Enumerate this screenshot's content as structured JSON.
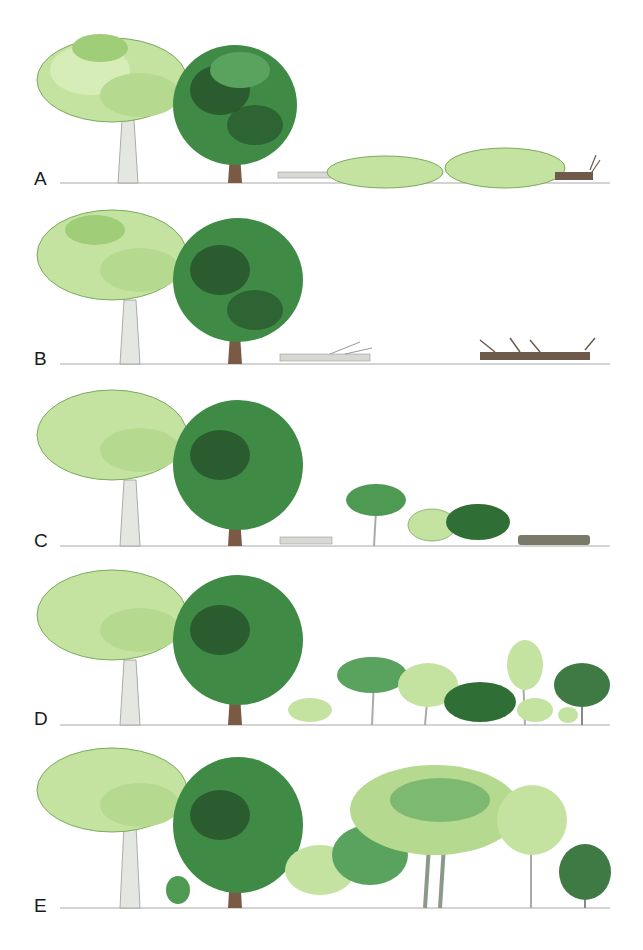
{
  "figure": {
    "colors": {
      "light_crown": "#c4e3a0",
      "light_crown_shade": "#8fc46a",
      "dark_crown": "#3f8a45",
      "dark_crown_shade": "#1d3d22",
      "birch_trunk": "#e4e6e2",
      "dark_trunk": "#7a5a44",
      "fallen_log_light": "#d8d8d2",
      "fallen_log_dark": "#6e5a4a",
      "ground": "#9a9a9a",
      "label": "#1a1a1a"
    },
    "panels": [
      {
        "label": "A",
        "stage": "canopy trees fall; crowns lie on ground"
      },
      {
        "label": "B",
        "stage": "crowns decay; fallen trunks and herbs remain"
      },
      {
        "label": "C",
        "stage": "saplings and shrubs establish in gap"
      },
      {
        "label": "D",
        "stage": "young trees grow taller in gap"
      },
      {
        "label": "E",
        "stage": "gap closes with maturing trees"
      }
    ]
  }
}
